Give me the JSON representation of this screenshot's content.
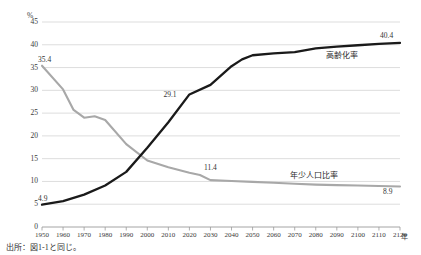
{
  "figure": {
    "title": "",
    "title_visible": false,
    "source_note": "出所：図1-1と同じ。"
  },
  "axes": {
    "y_unit": "%",
    "x_unit": "年"
  },
  "chart_data": {
    "type": "line",
    "title": "",
    "xlabel": "年",
    "ylabel": "%",
    "xlim": [
      1950,
      2120
    ],
    "ylim": [
      0,
      45
    ],
    "ytick_step": 5,
    "xtick_step": 10,
    "grid": true,
    "legend_position": "inline-right",
    "yticks": [
      "0",
      "5",
      "10",
      "15",
      "20",
      "25",
      "30",
      "35",
      "40",
      "45"
    ],
    "xticks": [
      "1950",
      "1960",
      "1970",
      "1980",
      "1990",
      "2000",
      "2010",
      "2020",
      "2030",
      "2040",
      "2050",
      "2060",
      "2070",
      "2080",
      "2090",
      "2100",
      "2110",
      "2120"
    ],
    "series": [
      {
        "name": "高齢化率",
        "color": "#1a1a1a",
        "x": [
          1950,
          1960,
          1970,
          1980,
          1990,
          2000,
          2010,
          2020,
          2030,
          2040,
          2045,
          2050,
          2060,
          2070,
          2080,
          2090,
          2100,
          2110,
          2120
        ],
        "values": [
          4.9,
          5.7,
          7.1,
          9.1,
          12.1,
          17.4,
          23.0,
          29.1,
          31.2,
          35.3,
          36.8,
          37.7,
          38.1,
          38.4,
          39.2,
          39.6,
          39.9,
          40.2,
          40.4
        ]
      },
      {
        "name": "年少人口比率",
        "color": "#a8a8a8",
        "x": [
          1950,
          1960,
          1965,
          1970,
          1975,
          1980,
          1990,
          2000,
          2010,
          2020,
          2025,
          2030,
          2040,
          2050,
          2060,
          2070,
          2080,
          2090,
          2100,
          2110,
          2120
        ],
        "values": [
          35.4,
          30.2,
          25.7,
          24.0,
          24.3,
          23.5,
          18.2,
          14.6,
          13.1,
          11.9,
          11.4,
          10.3,
          10.1,
          9.9,
          9.7,
          9.5,
          9.3,
          9.2,
          9.1,
          9.0,
          8.9
        ]
      }
    ],
    "annotations": [
      {
        "text": "35.4",
        "series": "年少人口比率",
        "x": 1950,
        "y": 35.4
      },
      {
        "text": "11.4",
        "series": "年少人口比率",
        "x": 2025,
        "y": 11.4
      },
      {
        "text": "8.9",
        "series": "年少人口比率",
        "x": 2120,
        "y": 8.9
      },
      {
        "text": "4.9",
        "series": "高齢化率",
        "x": 1950,
        "y": 4.9
      },
      {
        "text": "29.1",
        "series": "高齢化率",
        "x": 2020,
        "y": 29.1
      },
      {
        "text": "40.4",
        "series": "高齢化率",
        "x": 2120,
        "y": 40.4
      }
    ]
  },
  "labels": {
    "aging_rate": "高齢化率",
    "youth_ratio": "年少人口比率",
    "v_35_4": "35.4",
    "v_11_4": "11.4",
    "v_8_9": "8.9",
    "v_4_9": "4.9",
    "v_29_1": "29.1",
    "v_40_4": "40.4"
  },
  "colors": {
    "aging_line": "#1a1a1a",
    "youth_line": "#a8a8a8",
    "grid": "#cfcfcf",
    "axis": "#9a9a9a",
    "text": "#333333",
    "background": "#ffffff"
  }
}
